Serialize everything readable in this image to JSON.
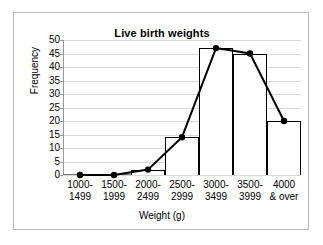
{
  "chart_data": {
    "type": "bar",
    "title": "Live birth weights",
    "xlabel": "Weight (g)",
    "ylabel": "Frequency",
    "categories": [
      "1000-\n1499",
      "1500-\n1999",
      "2000-\n2499",
      "2500-\n2999",
      "3000-\n3499",
      "3500-\n3999",
      "4000\n& over"
    ],
    "category_lines": [
      [
        "1000-",
        "1499"
      ],
      [
        "1500-",
        "1999"
      ],
      [
        "2000-",
        "2499"
      ],
      [
        "2500-",
        "2999"
      ],
      [
        "3000-",
        "3499"
      ],
      [
        "3500-",
        "3999"
      ],
      [
        "4000",
        "& over"
      ]
    ],
    "values": [
      0,
      0,
      2,
      14,
      47,
      45,
      20
    ],
    "series": [
      {
        "name": "Frequency (histogram bars)",
        "type": "bar",
        "values": [
          0,
          0,
          2,
          14,
          47,
          45,
          20
        ]
      },
      {
        "name": "Frequency polygon (line with markers)",
        "type": "line",
        "values": [
          0,
          0,
          2,
          14,
          47,
          45,
          20
        ]
      }
    ],
    "ylim": [
      0,
      50
    ],
    "ytick_labels": [
      "50",
      "45",
      "40",
      "35",
      "30",
      "25",
      "20",
      "15",
      "10",
      "5",
      "0"
    ],
    "ytick_values": [
      50,
      45,
      40,
      35,
      30,
      25,
      20,
      15,
      10,
      5,
      0
    ],
    "ytick_step": 5,
    "grid": true,
    "legend": "none",
    "colors": {
      "bar_outline": "#000000",
      "bar_fill": "#ffffff",
      "line": "#000000",
      "marker": "#000000",
      "gridline": "#d9d9d9",
      "axis": "#6f6f6f",
      "frame_border": "#b9b9b9",
      "background": "#ffffff",
      "text": "#000000"
    }
  }
}
